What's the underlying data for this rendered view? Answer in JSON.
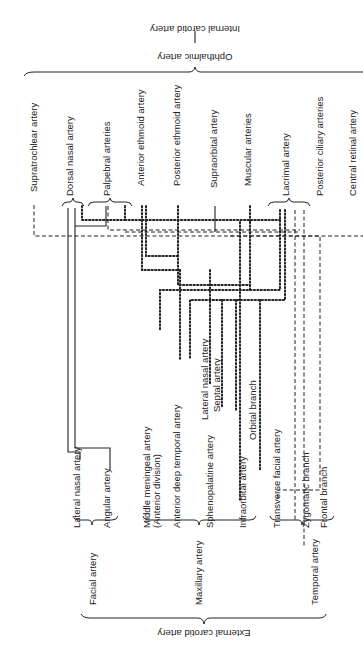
{
  "diagram": {
    "orientation": "rotated 90 degrees counter-clockwise",
    "top_labels": {
      "internal_carotid": "Internal carotid artery",
      "ophthalmic": "Ophthalmic artery"
    },
    "ophthalmic_branches": [
      "Supratrochlear artery",
      "Dorsal nasal artery",
      "Palpebral arteries",
      "Anterior ethmoid artery",
      "Posterior ethmoid artery",
      "Supraorbital artery",
      "Muscular arteries",
      "Lacrimal artery",
      "Posterior ciliary arteries",
      "Central retinal artery"
    ],
    "external_branches": {
      "facial": [
        "Lateral nasal artery",
        "Angular artery"
      ],
      "maxillary": [
        "Middle meningeal artery",
        "(Anterior division)",
        "Anterior deep temporal artery",
        "Sphenopalatine artery",
        "Lateral nasal artery",
        "Septal artery",
        "Infraorbital artery",
        "Orbital branch"
      ],
      "temporal": [
        "Transverse facial artery",
        "Zygomatic branch",
        "Frontal branch"
      ]
    },
    "group_labels": {
      "facial": "Facial artery",
      "maxillary": "Maxillary artery",
      "temporal": "Temporal artery"
    },
    "bottom_label": "External carotid artery"
  }
}
